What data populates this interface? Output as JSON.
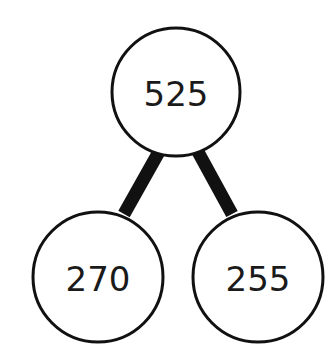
{
  "diagram": {
    "type": "number-bond",
    "whole": {
      "label": "525",
      "cx": 176,
      "cy": 92,
      "r": 64
    },
    "parts": [
      {
        "label": "270",
        "cx": 98,
        "cy": 277,
        "r": 65
      },
      {
        "label": "255",
        "cx": 258,
        "cy": 277,
        "r": 65
      }
    ],
    "edges": [
      {
        "x1": 160,
        "y1": 150,
        "x2": 124,
        "y2": 214
      },
      {
        "x1": 197,
        "y1": 150,
        "x2": 232,
        "y2": 214
      }
    ],
    "colors": {
      "stroke": "#111111",
      "fill": "#ffffff",
      "text": "#1a1a1a"
    }
  }
}
